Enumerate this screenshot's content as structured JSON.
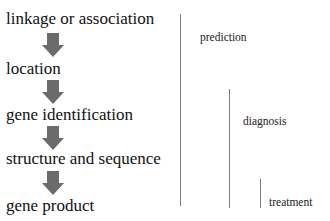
{
  "flow": {
    "steps": [
      {
        "label": "linkage or association"
      },
      {
        "label": "location"
      },
      {
        "label": "gene identification"
      },
      {
        "label": "structure and sequence"
      },
      {
        "label": "gene product"
      }
    ],
    "arrow_color": "#6b6b6b"
  },
  "applications": [
    {
      "label": "prediction"
    },
    {
      "label": "diagnosis"
    },
    {
      "label": "treatment"
    }
  ]
}
